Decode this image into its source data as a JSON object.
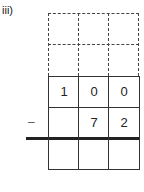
{
  "problem": {
    "label": "iii)",
    "operator": "–",
    "rows": [
      [
        "",
        "",
        ""
      ],
      [
        "",
        "",
        ""
      ],
      [
        "1",
        "0",
        "0"
      ],
      [
        "",
        "7",
        "2"
      ],
      [
        "",
        "",
        ""
      ]
    ]
  }
}
